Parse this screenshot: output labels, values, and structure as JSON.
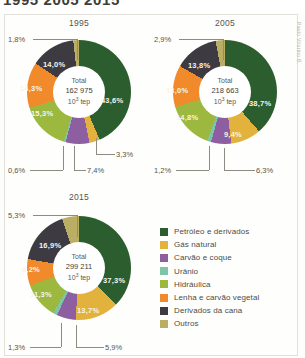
{
  "title": "1995 2005 2015",
  "credit": "Paulo Vitorino B.",
  "unit_label": "Total",
  "unit_suffix": "10³ tep",
  "colors": {
    "petroleo": "#2c5d2e",
    "gas": "#e3b23c",
    "carvao_coque": "#8d5fa0",
    "uranio": "#7ec4a8",
    "hidraulica": "#9cb83f",
    "lenha": "#f08a2a",
    "derivados_cana": "#3d3a42",
    "outros": "#b9ae64"
  },
  "legend": {
    "items": [
      {
        "label": "Petróleo e derivados",
        "color_key": "petroleo"
      },
      {
        "label": "Gás natural",
        "color_key": "gas"
      },
      {
        "label": "Carvão e coque",
        "color_key": "carvao_coque"
      },
      {
        "label": "Urânio",
        "color_key": "uranio"
      },
      {
        "label": "Hidráulica",
        "color_key": "hidraulica"
      },
      {
        "label": "Lenha e carvão vegetal",
        "color_key": "lenha"
      },
      {
        "label": "Derivados da cana",
        "color_key": "derivados_cana"
      },
      {
        "label": "Outros",
        "color_key": "outros"
      }
    ]
  },
  "chart_data": [
    {
      "type": "pie",
      "title": "1995",
      "total_label": "Total",
      "total_value": "162 975",
      "unit": "10³ tep",
      "categories": [
        "Petróleo e derivados",
        "Gás natural",
        "Carvão e coque",
        "Urânio",
        "Hidráulica",
        "Lenha e carvão vegetal",
        "Derivados da cana",
        "Outros"
      ],
      "values": [
        43.6,
        3.3,
        7.4,
        0.6,
        15.3,
        14.3,
        14.0,
        1.8
      ],
      "labels": [
        "43,6%",
        "3,3%",
        "7,4%",
        "0,6%",
        "15,3%",
        "14,3%",
        "14,0%",
        "1,8%"
      ],
      "ylabel": "",
      "xlabel": ""
    },
    {
      "type": "pie",
      "title": "2005",
      "total_label": "Total",
      "total_value": "218 663",
      "unit": "10³ tep",
      "categories": [
        "Petróleo e derivados",
        "Gás natural",
        "Carvão e coque",
        "Urânio",
        "Hidráulica",
        "Lenha e carvão vegetal",
        "Derivados da cana",
        "Outros"
      ],
      "values": [
        38.7,
        9.4,
        6.3,
        1.2,
        14.8,
        13.0,
        13.8,
        2.9
      ],
      "labels": [
        "38,7%",
        "9,4%",
        "6,3%",
        "1,2%",
        "14,8%",
        "13,0%",
        "13,8%",
        "2,9%"
      ],
      "ylabel": "",
      "xlabel": ""
    },
    {
      "type": "pie",
      "title": "2015",
      "total_label": "Total",
      "total_value": "299 211",
      "unit": "10³ tep",
      "categories": [
        "Petróleo e derivados",
        "Gás natural",
        "Carvão e coque",
        "Urânio",
        "Hidráulica",
        "Lenha e carvão vegetal",
        "Derivados da cana",
        "Outros"
      ],
      "values": [
        37.3,
        13.7,
        5.9,
        1.3,
        11.3,
        8.2,
        16.9,
        5.3
      ],
      "labels": [
        "37,3%",
        "13,7%",
        "5,9%",
        "1,3%",
        "11,3%",
        "8,2%",
        "16,9%",
        "5,3%"
      ],
      "ylabel": "",
      "xlabel": ""
    }
  ]
}
